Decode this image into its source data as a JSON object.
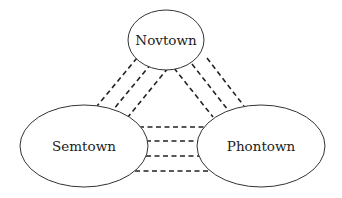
{
  "diagram": {
    "type": "network",
    "nodes": [
      {
        "id": "novtown",
        "label": "Novtown",
        "cx": 166,
        "cy": 40,
        "rx": 38,
        "ry": 30
      },
      {
        "id": "semtown",
        "label": "Semtown",
        "cx": 84,
        "cy": 146,
        "rx": 64,
        "ry": 41
      },
      {
        "id": "phontown",
        "label": "Phontown",
        "cx": 261,
        "cy": 146,
        "rx": 64,
        "ry": 41
      }
    ],
    "edges": [
      {
        "from": "novtown",
        "to": "semtown",
        "count": 3
      },
      {
        "from": "novtown",
        "to": "phontown",
        "count": 3
      },
      {
        "from": "semtown",
        "to": "phontown",
        "count": 4
      }
    ],
    "line_style": "dashed",
    "colors": {
      "stroke": "#222222",
      "background": "#ffffff"
    }
  }
}
